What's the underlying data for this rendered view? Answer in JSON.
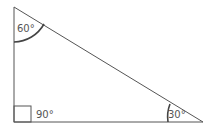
{
  "diagram": {
    "type": "right-triangle",
    "angles": {
      "top": "60°",
      "right_angle": "90°",
      "bottom_right": "30°"
    },
    "colors": {
      "line": "#555555",
      "arc": "#444444",
      "background": "#ffffff"
    }
  }
}
